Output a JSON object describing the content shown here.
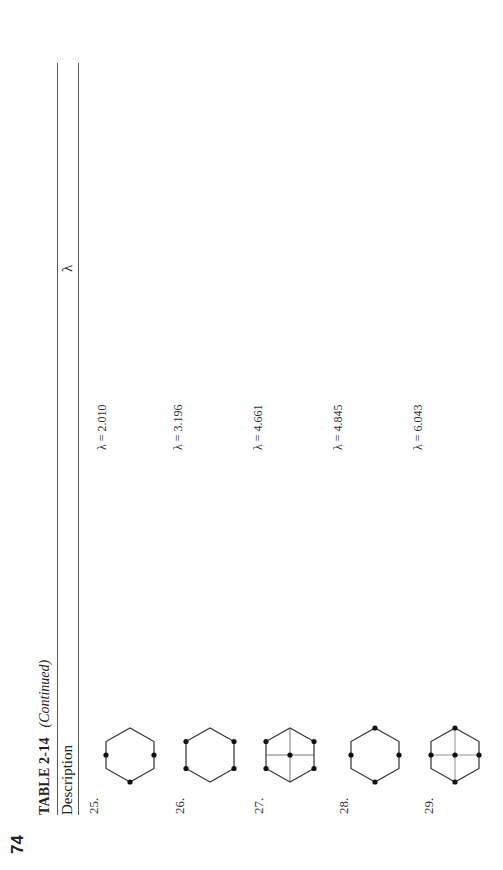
{
  "page": {
    "number": "74",
    "table_label": "TABLE 2-14",
    "table_continued": "(Continued)",
    "columns": [
      "Description",
      "λ"
    ]
  },
  "rows": [
    {
      "label": "25.",
      "lambda": "λ = 2.010",
      "figure": "hexagon-dots-3-alt",
      "figure_desc": "hexagon with dots at left, right and bottom vertices"
    },
    {
      "label": "26.",
      "lambda": "λ = 3.196",
      "figure": "hexagon-dots-4-sides",
      "figure_desc": "hexagon with dots at the four side vertices"
    },
    {
      "label": "27.",
      "lambda": "λ = 4.661",
      "figure": "hexagon-cross-center",
      "figure_desc": "hexagon with four side dots, horizontal and vertical lines and center dot"
    },
    {
      "label": "28.",
      "lambda": "λ = 4.845",
      "figure": "hexagon-dots-4-axis",
      "figure_desc": "hexagon with dots at top, bottom, left and right"
    },
    {
      "label": "29.",
      "lambda": "λ = 6.043",
      "figure": "hexagon-cross-5-dots",
      "figure_desc": "hexagon with dots at top, bottom, left, right and center with cross lines"
    }
  ]
}
